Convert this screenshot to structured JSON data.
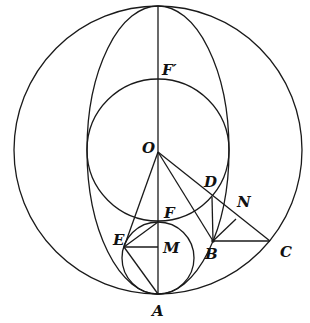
{
  "diagram": {
    "type": "geometry",
    "colors": {
      "stroke": "#1a1a1a",
      "label": "#111111",
      "background": "#ffffff"
    },
    "shapes": {
      "outer_circle": {
        "cx": 158,
        "cy": 150,
        "r": 144
      },
      "ellipse": {
        "cx": 158,
        "cy": 150,
        "rx": 71,
        "ry": 144
      },
      "middle_circle": {
        "cx": 158,
        "cy": 150,
        "r": 71
      },
      "small_circle": {
        "cx": 158,
        "cy": 258,
        "r": 36
      }
    },
    "points": {
      "A": {
        "label": "A",
        "x": 158,
        "y": 294
      },
      "O": {
        "label": "O",
        "x": 158,
        "y": 152
      },
      "F_prime": {
        "label": "F′",
        "x": 158,
        "y": 79
      },
      "F": {
        "label": "F",
        "x": 158,
        "y": 222
      },
      "M": {
        "label": "M",
        "x": 158,
        "y": 247
      },
      "E": {
        "label": "E",
        "x": 124,
        "y": 247
      },
      "D": {
        "label": "D",
        "x": 212,
        "y": 197
      },
      "B": {
        "label": "B",
        "x": 213,
        "y": 241
      },
      "N": {
        "label": "N",
        "x": 236,
        "y": 219
      },
      "C": {
        "label": "C",
        "x": 270,
        "y": 241
      }
    },
    "segments": [
      "top-A (vertical axis)",
      "O-E",
      "O-B",
      "O-C",
      "E-F",
      "E-M",
      "E-A",
      "D-B",
      "B-N",
      "B-C"
    ]
  }
}
